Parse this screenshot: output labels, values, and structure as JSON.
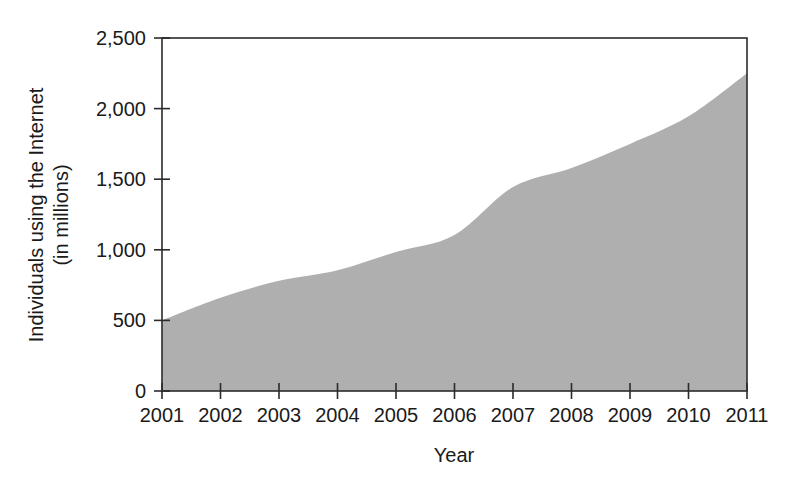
{
  "chart_data": {
    "type": "area",
    "title": "",
    "xlabel": "Year",
    "ylabel_line1": "Individuals using the Internet",
    "ylabel_line2": "(in millions)",
    "ylabel": "Individuals using the Internet (in millions)",
    "categories": [
      "2001",
      "2002",
      "2003",
      "2004",
      "2005",
      "2006",
      "2007",
      "2008",
      "2009",
      "2010",
      "2011"
    ],
    "x": [
      2001,
      2002,
      2003,
      2004,
      2005,
      2006,
      2007,
      2008,
      2009,
      2010,
      2011
    ],
    "values": [
      500,
      660,
      780,
      855,
      985,
      1105,
      1445,
      1580,
      1750,
      1945,
      2250
    ],
    "series": [
      {
        "name": "Individuals using the Internet",
        "values": [
          500,
          660,
          780,
          855,
          985,
          1105,
          1445,
          1580,
          1750,
          1945,
          2250
        ]
      }
    ],
    "xlim": [
      2001,
      2011
    ],
    "ylim": [
      0,
      2500
    ],
    "ytick_values": [
      0,
      500,
      1000,
      1500,
      2000,
      2500
    ],
    "ytick_labels": [
      "0",
      "500",
      "1,000",
      "1,500",
      "2,000",
      "2,500"
    ],
    "xtick_labels": [
      "2001",
      "2002",
      "2003",
      "2004",
      "2005",
      "2006",
      "2007",
      "2008",
      "2009",
      "2010",
      "2011"
    ],
    "grid": false,
    "legend": "none",
    "area_color": "#a8a8a8",
    "axis_color": "#2b2b2b",
    "background_color": "#ffffff"
  }
}
